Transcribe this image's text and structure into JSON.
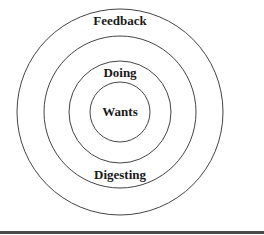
{
  "diagram": {
    "type": "concentric-circles",
    "center": {
      "x": 120,
      "y": 112
    },
    "rings": [
      {
        "name": "Feedback",
        "radius": 103,
        "label": "Feedback",
        "label_pos": {
          "x": 120,
          "y": 25
        }
      },
      {
        "name": "Digesting",
        "radius": 76,
        "label": "Digesting",
        "label_pos": {
          "x": 120,
          "y": 179
        }
      },
      {
        "name": "Doing",
        "radius": 51,
        "label": "Doing",
        "label_pos": {
          "x": 120,
          "y": 77
        }
      },
      {
        "name": "Wants",
        "radius": 30,
        "label": "Wants",
        "label_pos": {
          "x": 120,
          "y": 116
        }
      }
    ],
    "labels": {
      "outer": "Feedback",
      "second": "Digesting",
      "third": "Doing",
      "inner": "Wants"
    },
    "colors": {
      "stroke": "#444444",
      "text": "#1a1a1a",
      "rule": "#4a4a4a",
      "background": "#ffffff"
    }
  }
}
